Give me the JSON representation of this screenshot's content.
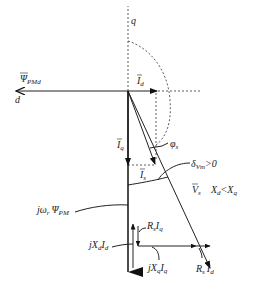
{
  "diagram": {
    "title": "",
    "type": "phasor-diagram",
    "axes": {
      "q_label": "q",
      "d_label": "d"
    },
    "labels": {
      "psi_pmd": {
        "main": "Ψ",
        "sub": "PMd"
      },
      "i_d": {
        "main": "I",
        "sub": "d"
      },
      "i_q": {
        "main": "I",
        "sub": "q"
      },
      "i_s": {
        "main": "I",
        "sub": "s"
      },
      "phi_s": {
        "main": "φ",
        "sub": "s"
      },
      "delta": {
        "main": "δ",
        "sub": "Vm",
        "suffix": ">0"
      },
      "v_s": {
        "main": "V",
        "sub": "s"
      },
      "condition": {
        "a": "X",
        "a_sub": "d",
        "op": "<",
        "b": "X",
        "b_sub": "q"
      },
      "jw_psi_pm": {
        "prefix": "jω",
        "prefix_sub": "r",
        "main": "Ψ",
        "sub": "PM"
      },
      "rs_iq": {
        "a": "R",
        "a_sub": "s",
        "b": "I",
        "b_sub": "q"
      },
      "jxd_id": {
        "prefix": "jX",
        "prefix_sub": "d",
        "b": "I",
        "b_sub": "d"
      },
      "jxq_iq": {
        "prefix": "jX",
        "prefix_sub": "q",
        "b": "I",
        "b_sub": "q"
      },
      "rs_id": {
        "a": "R",
        "a_sub": "s",
        "b": "I",
        "b_sub": "d"
      }
    },
    "colors": {
      "line": "#222222",
      "background": "#ffffff"
    }
  }
}
